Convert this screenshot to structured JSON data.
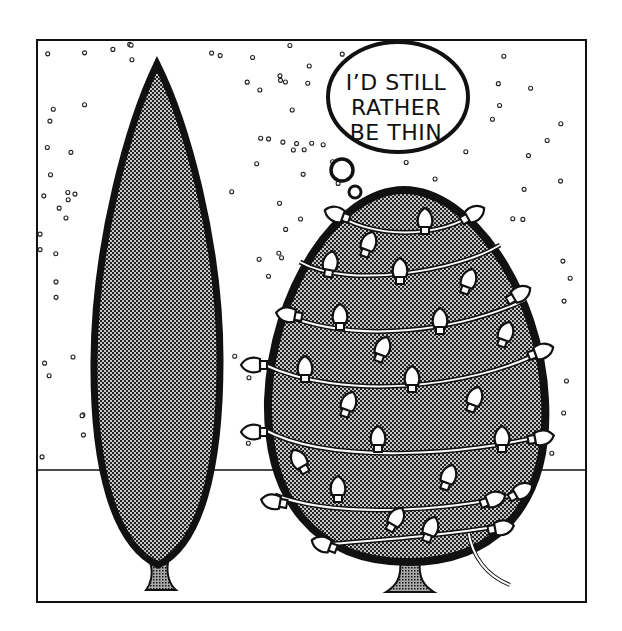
{
  "cartoon": {
    "thought_bubble": {
      "lines": [
        "I’D STILL",
        "RATHER",
        "BE THIN"
      ]
    },
    "subjects": [
      "thin-cypress-tree",
      "round-tree-with-christmas-lights"
    ],
    "colors": {
      "ink": "#111111",
      "background": "#ffffff",
      "light_bulb_fill": "#ffffff"
    }
  }
}
